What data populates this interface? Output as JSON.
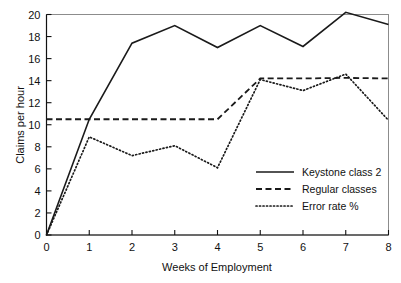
{
  "chart_data": {
    "type": "line",
    "title": "",
    "xlabel": "Weeks of Employment",
    "ylabel": "Claims per hour",
    "x": [
      0,
      1,
      2,
      3,
      4,
      5,
      6,
      7,
      8
    ],
    "xlim": [
      0,
      8
    ],
    "ylim": [
      0,
      20
    ],
    "xticks": [
      "0",
      "1",
      "2",
      "3",
      "4",
      "5",
      "6",
      "7",
      "8"
    ],
    "yticks": [
      "0",
      "2",
      "4",
      "6",
      "8",
      "10",
      "12",
      "14",
      "16",
      "18",
      "20"
    ],
    "grid": false,
    "legend_position": "center-right",
    "series": [
      {
        "name": "Keystone class 2",
        "style": "solid",
        "color": "#1a1a1a",
        "values": [
          0,
          10.5,
          17.4,
          19.0,
          17.0,
          19.0,
          17.1,
          20.2,
          19.1
        ]
      },
      {
        "name": "Regular classes",
        "style": "dashed",
        "color": "#1a1a1a",
        "values": [
          10.5,
          10.5,
          10.5,
          10.5,
          10.5,
          14.2,
          14.2,
          14.25,
          14.2
        ]
      },
      {
        "name": "Error rate %",
        "style": "dotted",
        "color": "#1a1a1a",
        "values": [
          0,
          8.9,
          7.2,
          8.1,
          6.1,
          14.1,
          13.1,
          14.6,
          10.4
        ]
      }
    ]
  },
  "legend": {
    "items": [
      {
        "label": "Keystone class 2",
        "style": "solid"
      },
      {
        "label": "Regular classes",
        "style": "dashed"
      },
      {
        "label": "Error rate %",
        "style": "dotted"
      }
    ]
  }
}
